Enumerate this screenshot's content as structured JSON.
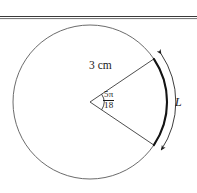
{
  "figure": {
    "kind": "circle-sector-arc-length-diagram",
    "labels": {
      "radius": "3 cm",
      "arc_length": "L",
      "angle_numerator": "5π",
      "angle_denominator": "18"
    },
    "colors": {
      "stroke": "#1a1a1a",
      "circle_stroke": "#555555",
      "background": "#ffffff",
      "rule": "#333333"
    },
    "geometry": {
      "circle_center_x": 90,
      "circle_center_y": 102,
      "circle_radius": 77,
      "sector_start_angle_deg": -34,
      "sector_end_angle_deg": 34,
      "measure_arc_radius": 86,
      "angle_marker_radius": 14,
      "top_rule_y": 17
    }
  }
}
